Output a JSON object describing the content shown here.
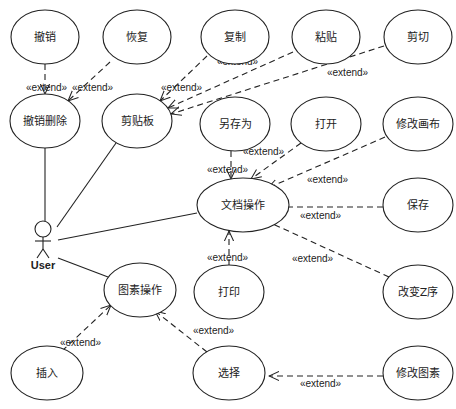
{
  "diagram": {
    "type": "UML use case diagram",
    "actor": {
      "id": "user",
      "label": "User",
      "x": 43,
      "y": 235
    },
    "use_cases": [
      {
        "id": "undo",
        "label": "撤销",
        "cx": 45,
        "cy": 37,
        "rx": 34,
        "ry": 27
      },
      {
        "id": "redo",
        "label": "恢复",
        "cx": 137,
        "cy": 37,
        "rx": 34,
        "ry": 27
      },
      {
        "id": "copy",
        "label": "复制",
        "cx": 235,
        "cy": 37,
        "rx": 34,
        "ry": 27
      },
      {
        "id": "paste",
        "label": "粘贴",
        "cx": 326,
        "cy": 37,
        "rx": 34,
        "ry": 27
      },
      {
        "id": "cut",
        "label": "剪切",
        "cx": 418,
        "cy": 37,
        "rx": 34,
        "ry": 27
      },
      {
        "id": "undo-delete",
        "label": "撤销删除",
        "cx": 45,
        "cy": 121,
        "rx": 35,
        "ry": 27
      },
      {
        "id": "clipboard",
        "label": "剪贴板",
        "cx": 137,
        "cy": 121,
        "rx": 35,
        "ry": 27
      },
      {
        "id": "save-as",
        "label": "另存为",
        "cx": 235,
        "cy": 124,
        "rx": 35,
        "ry": 27
      },
      {
        "id": "open",
        "label": "打开",
        "cx": 326,
        "cy": 124,
        "rx": 35,
        "ry": 27
      },
      {
        "id": "modify-canvas",
        "label": "修改画布",
        "cx": 418,
        "cy": 124,
        "rx": 35,
        "ry": 27
      },
      {
        "id": "document-ops",
        "label": "文档操作",
        "cx": 243,
        "cy": 205,
        "rx": 46,
        "ry": 27
      },
      {
        "id": "save",
        "label": "保存",
        "cx": 418,
        "cy": 205,
        "rx": 35,
        "ry": 27
      },
      {
        "id": "print",
        "label": "打印",
        "cx": 229,
        "cy": 292,
        "rx": 35,
        "ry": 27
      },
      {
        "id": "change-z-order",
        "label": "改变Z序",
        "cx": 418,
        "cy": 292,
        "rx": 35,
        "ry": 27
      },
      {
        "id": "primitive-ops",
        "label": "图素操作",
        "cx": 140,
        "cy": 290,
        "rx": 36,
        "ry": 27
      },
      {
        "id": "insert",
        "label": "插入",
        "cx": 47,
        "cy": 373,
        "rx": 36,
        "ry": 27
      },
      {
        "id": "select",
        "label": "选择",
        "cx": 229,
        "cy": 373,
        "rx": 36,
        "ry": 27
      },
      {
        "id": "modify-primitive",
        "label": "修改图素",
        "cx": 418,
        "cy": 373,
        "rx": 35,
        "ry": 27
      }
    ],
    "associations": [
      {
        "from": "user",
        "to": "undo-delete",
        "x1": 45,
        "y1": 222,
        "x2": 45,
        "y2": 148
      },
      {
        "from": "user",
        "to": "clipboard",
        "x1": 57,
        "y1": 227,
        "x2": 116,
        "y2": 143
      },
      {
        "from": "user",
        "to": "document-ops",
        "x1": 58,
        "y1": 240,
        "x2": 197,
        "y2": 213
      },
      {
        "from": "user",
        "to": "primitive-ops",
        "x1": 58,
        "y1": 258,
        "x2": 108,
        "y2": 277
      }
    ],
    "extends": [
      {
        "from": "undo",
        "to": "undo-delete",
        "label": "«extend»",
        "x1": 45,
        "y1": 64,
        "x2": 45,
        "y2": 94,
        "lx": 26,
        "ly": 91
      },
      {
        "from": "redo",
        "to": "undo-delete",
        "label": "«extend»",
        "x1": 110,
        "y1": 62,
        "x2": 68,
        "y2": 101,
        "lx": 72,
        "ly": 91
      },
      {
        "from": "copy",
        "to": "clipboard",
        "label": "«extend»",
        "x1": 207,
        "y1": 56,
        "x2": 160,
        "y2": 101,
        "lx": 161,
        "ly": 91
      },
      {
        "from": "paste",
        "to": "clipboard",
        "label": "«extend»",
        "x1": 293,
        "y1": 52,
        "x2": 168,
        "y2": 108,
        "lx": 217,
        "ly": 65
      },
      {
        "from": "cut",
        "to": "clipboard",
        "label": "«extend»",
        "x1": 384,
        "y1": 46,
        "x2": 171,
        "y2": 114,
        "lx": 327,
        "ly": 76
      },
      {
        "from": "save-as",
        "to": "document-ops",
        "label": "«extend»",
        "x1": 231,
        "y1": 151,
        "x2": 231,
        "y2": 179,
        "lx": 207,
        "ly": 173
      },
      {
        "from": "open",
        "to": "document-ops",
        "label": "«extend»",
        "x1": 301,
        "y1": 143,
        "x2": 251,
        "y2": 179,
        "lx": 243,
        "ly": 155
      },
      {
        "from": "modify-canvas",
        "to": "document-ops",
        "label": "«extend»",
        "x1": 385,
        "y1": 137,
        "x2": 268,
        "y2": 188,
        "lx": 307,
        "ly": 183
      },
      {
        "from": "save",
        "to": "document-ops",
        "label": "«extend»",
        "x1": 383,
        "y1": 207,
        "x2": 269,
        "y2": 207,
        "lx": 300,
        "ly": 219
      },
      {
        "from": "change-z-order",
        "to": "document-ops",
        "label": "«extend»",
        "x1": 389,
        "y1": 277,
        "x2": 262,
        "y2": 219,
        "lx": 292,
        "ly": 262
      },
      {
        "from": "print",
        "to": "document-ops",
        "label": "«extend»",
        "x1": 229,
        "y1": 265,
        "x2": 229,
        "y2": 231,
        "lx": 207,
        "ly": 261
      },
      {
        "from": "insert",
        "to": "primitive-ops",
        "label": "«extend»",
        "x1": 62,
        "y1": 351,
        "x2": 111,
        "y2": 305,
        "lx": 60,
        "ly": 346
      },
      {
        "from": "select",
        "to": "primitive-ops",
        "label": "«extend»",
        "x1": 207,
        "y1": 352,
        "x2": 155,
        "y2": 311,
        "lx": 193,
        "ly": 334
      },
      {
        "from": "modify-primitive",
        "to": "select",
        "label": "«extend»",
        "x1": 383,
        "y1": 376,
        "x2": 269,
        "y2": 376,
        "lx": 300,
        "ly": 387
      }
    ],
    "colors": {
      "stroke": "#222222",
      "background": "#ffffff",
      "text": "#222222"
    }
  }
}
